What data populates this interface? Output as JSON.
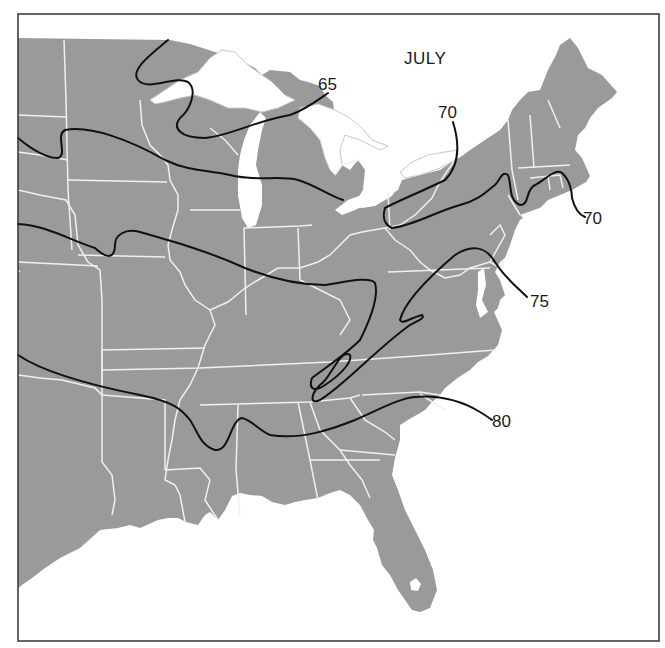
{
  "map": {
    "title": "JULY",
    "subject": "Mean July temperature isotherms, eastern United States",
    "colors": {
      "land": "#9a9a9a",
      "water": "#ffffff",
      "state_borders": "#f2f2f2",
      "isotherms": "#111111",
      "frame": "#333333",
      "lake_outline": "#cfcfcf"
    },
    "isotherms": [
      {
        "value": "65",
        "label": "65"
      },
      {
        "value": "70",
        "label": "70"
      },
      {
        "value": "70",
        "label": "70"
      },
      {
        "value": "75",
        "label": "75"
      },
      {
        "value": "80",
        "label": "80"
      }
    ]
  }
}
